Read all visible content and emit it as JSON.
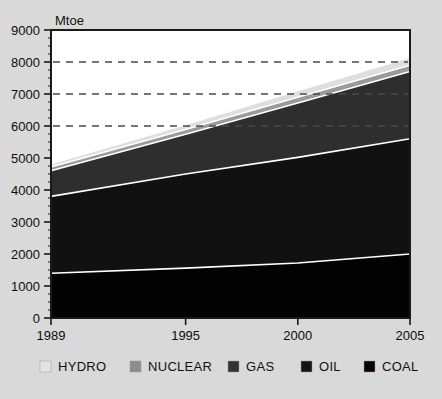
{
  "figure": {
    "background_color": "#d9d9d9",
    "plot_background_color": "#ffffff",
    "frame_color": "#1a1a1a"
  },
  "chart_data": {
    "type": "area",
    "stacked": true,
    "title": "",
    "subtitle": "",
    "xlabel": "",
    "ylabel": "Mtoe",
    "unit_label": "Mtoe",
    "x": [
      1989,
      1995,
      2000,
      2005
    ],
    "xlim": [
      1989,
      2005
    ],
    "ylim": [
      0,
      9000
    ],
    "xtick_labels": [
      "1989",
      "1995",
      "2000",
      "2005"
    ],
    "ytick_labels": [
      "0",
      "1000",
      "2000",
      "3000",
      "4000",
      "5000",
      "6000",
      "7000",
      "8000",
      "9000"
    ],
    "ytick_values": [
      0,
      1000,
      2000,
      3000,
      4000,
      5000,
      6000,
      7000,
      8000,
      9000
    ],
    "grid": "horizontal-dashed",
    "gridlines_at": [
      6000,
      7000,
      8000
    ],
    "legend_position": "bottom",
    "series": [
      {
        "name": "COAL",
        "color": "#020202",
        "legend_swatch": "#050505",
        "values": [
          1400,
          1560,
          1720,
          2000
        ]
      },
      {
        "name": "OIL",
        "color": "#111111",
        "legend_swatch": "#141414",
        "values": [
          2400,
          2940,
          3300,
          3600
        ]
      },
      {
        "name": "GAS",
        "color": "#2e2e2e",
        "legend_swatch": "#333333",
        "values": [
          800,
          1240,
          1700,
          2100
        ]
      },
      {
        "name": "NUCLEAR",
        "color": "#9a9a9a",
        "legend_swatch": "#8d8d8d",
        "values": [
          120,
          150,
          180,
          200
        ]
      },
      {
        "name": "HYDRO",
        "color": "#dedede",
        "legend_swatch": "#e3e3e3",
        "values": [
          100,
          160,
          210,
          250
        ]
      }
    ],
    "cumulative_tops": {
      "coal": [
        1400,
        1560,
        1720,
        2000
      ],
      "oil": [
        3800,
        4500,
        5020,
        5600
      ],
      "gas": [
        4600,
        5740,
        6720,
        7700
      ],
      "nuclear": [
        4720,
        5890,
        6900,
        7900
      ],
      "hydro": [
        4820,
        6050,
        7110,
        8150
      ]
    },
    "annotations": []
  },
  "legend": {
    "items": [
      {
        "label": "HYDRO"
      },
      {
        "label": "NUCLEAR"
      },
      {
        "label": "GAS"
      },
      {
        "label": "OIL"
      },
      {
        "label": "COAL"
      }
    ]
  },
  "caption": {
    "text": ""
  }
}
